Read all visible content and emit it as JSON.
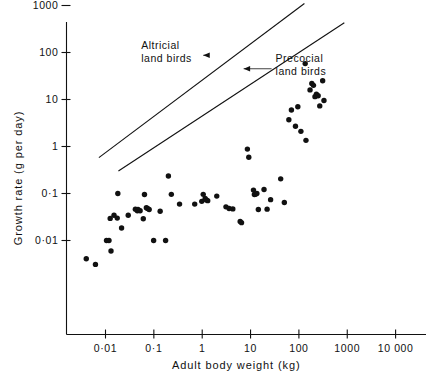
{
  "chart_data": {
    "type": "scatter",
    "title": "",
    "xlabel": "Adult body weight (kg)",
    "ylabel": "Growth rate (g per day)",
    "xscale": "log",
    "yscale": "log",
    "xlim": [
      0.0017,
      31000
    ],
    "ylim": [
      0.0022,
      3400
    ],
    "grid": false,
    "legend": "none",
    "xticks": [
      0.01,
      0.1,
      1,
      10,
      100,
      1000,
      10000
    ],
    "xticklabels": [
      "0·01",
      "0·1",
      "1",
      "10",
      "100",
      "1000",
      "10 000"
    ],
    "yticks": [
      0.01,
      0.1,
      1,
      10,
      100,
      1000
    ],
    "yticklabels": [
      "0·01",
      "0·1",
      "1",
      "10",
      "100",
      "1000"
    ],
    "annotations": [
      {
        "id": "altricial",
        "text_line1": "Altricial",
        "text_line2": "land birds",
        "text_x": 0.055,
        "text_y": 120,
        "arrow_to_x": 1.05,
        "arrow_to_y": 33
      },
      {
        "id": "precocial",
        "text_line1": "Precocial",
        "text_line2": "land birds",
        "text_x": 33,
        "text_y": 62,
        "arrow_to_x": 7.2,
        "arrow_to_y": 21
      }
    ],
    "series": [
      {
        "name": "Altricial land birds trend line",
        "type": "line",
        "x": [
          0.0073,
          130
        ],
        "y": [
          0.58,
          1100
        ]
      },
      {
        "name": "Precocial land birds trend line",
        "type": "line",
        "x": [
          0.0185,
          870
        ],
        "y": [
          0.3,
          430
        ]
      },
      {
        "name": "Bird species",
        "type": "scatter",
        "points": [
          [
            0.004,
            0.0041
          ],
          [
            0.0062,
            0.0031
          ],
          [
            0.0105,
            0.01
          ],
          [
            0.0118,
            0.01
          ],
          [
            0.0125,
            0.0295
          ],
          [
            0.013,
            0.006
          ],
          [
            0.015,
            0.0345
          ],
          [
            0.0175,
            0.03
          ],
          [
            0.018,
            0.1
          ],
          [
            0.0215,
            0.0185
          ],
          [
            0.0295,
            0.0345
          ],
          [
            0.0415,
            0.0465
          ],
          [
            0.0455,
            0.043
          ],
          [
            0.047,
            0.0455
          ],
          [
            0.052,
            0.043
          ],
          [
            0.0605,
            0.029
          ],
          [
            0.064,
            0.0955
          ],
          [
            0.07,
            0.05
          ],
          [
            0.074,
            0.048
          ],
          [
            0.08,
            0.0455
          ],
          [
            0.099,
            0.01
          ],
          [
            0.135,
            0.042
          ],
          [
            0.175,
            0.01
          ],
          [
            0.2,
            0.235
          ],
          [
            0.23,
            0.096
          ],
          [
            0.34,
            0.0595
          ],
          [
            0.7,
            0.0595
          ],
          [
            0.98,
            0.068
          ],
          [
            1.05,
            0.096
          ],
          [
            1.15,
            0.078
          ],
          [
            1.22,
            0.073
          ],
          [
            1.3,
            0.0705
          ],
          [
            2.0,
            0.088
          ],
          [
            3.1,
            0.052
          ],
          [
            3.6,
            0.048
          ],
          [
            4.3,
            0.047
          ],
          [
            6.1,
            0.0255
          ],
          [
            6.5,
            0.024
          ],
          [
            8.6,
            0.88
          ],
          [
            9.2,
            0.59
          ],
          [
            11.5,
            0.118
          ],
          [
            12.0,
            0.095
          ],
          [
            12.6,
            0.096
          ],
          [
            13.5,
            0.1
          ],
          [
            14.5,
            0.0455
          ],
          [
            19.0,
            0.122
          ],
          [
            22.0,
            0.0465
          ],
          [
            26.0,
            0.074
          ],
          [
            42.0,
            0.205
          ],
          [
            50.0,
            0.0645
          ],
          [
            62.0,
            3.7
          ],
          [
            70.0,
            6.0
          ],
          [
            85.0,
            2.7
          ],
          [
            95.0,
            7.0
          ],
          [
            110.0,
            2.1
          ],
          [
            140.0,
            1.35
          ],
          [
            170.0,
            16.0
          ],
          [
            185.0,
            22.0
          ],
          [
            200.0,
            20.0
          ],
          [
            215.0,
            11.5
          ],
          [
            230.0,
            13.0
          ],
          [
            250.0,
            12.0
          ],
          [
            270.0,
            7.3
          ],
          [
            310.0,
            25.0
          ],
          [
            330.0,
            9.5
          ],
          [
            135.0,
            58.0
          ]
        ]
      }
    ]
  }
}
